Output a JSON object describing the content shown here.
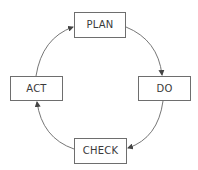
{
  "diagram": {
    "type": "cycle",
    "title": "",
    "nodes": [
      {
        "id": "plan",
        "label": "PLAN"
      },
      {
        "id": "do",
        "label": "DO"
      },
      {
        "id": "check",
        "label": "CHECK"
      },
      {
        "id": "act",
        "label": "ACT"
      }
    ],
    "edges": [
      {
        "from": "plan",
        "to": "do",
        "direction": "clockwise"
      },
      {
        "from": "do",
        "to": "check",
        "direction": "clockwise"
      },
      {
        "from": "check",
        "to": "act",
        "direction": "clockwise"
      },
      {
        "from": "act",
        "to": "plan",
        "direction": "clockwise"
      }
    ],
    "colors": {
      "box_border": "#6e6e6e",
      "text": "#3a3a3a",
      "arrow": "#555555",
      "background": "#ffffff"
    }
  }
}
